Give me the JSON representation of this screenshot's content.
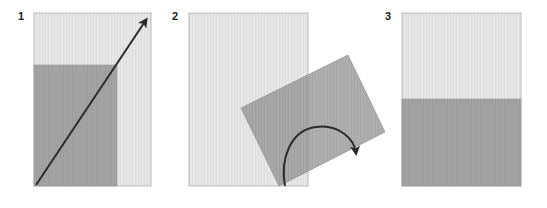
{
  "diagram": {
    "title": "",
    "colors": {
      "background": "#ffffff",
      "page_light": "#e6e6e6",
      "page_dark": "#a3a3a3",
      "page_border": "#bcbcbc",
      "arrow": "#2a2a2a"
    },
    "steps": [
      {
        "label": "1",
        "description": "Light rectangular page with darker rectangle in lower-left; diagonal arrow from bottom-left corner to top-right corner",
        "icon": "diagonal-arrow-icon"
      },
      {
        "label": "2",
        "description": "Dark rectangle rotated and overlapping the light page; curved rotation arrow",
        "icon": "rotate-arrow-icon"
      },
      {
        "label": "3",
        "description": "Light page with dark lower half filling the width",
        "icon": ""
      }
    ]
  }
}
